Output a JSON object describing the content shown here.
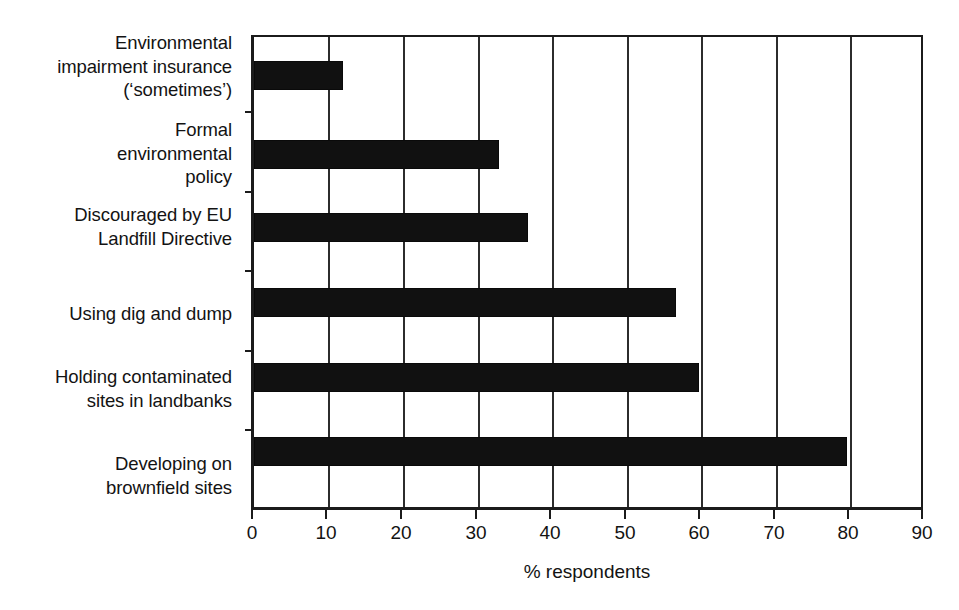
{
  "chart_data": {
    "type": "bar",
    "orientation": "horizontal",
    "title": "",
    "subtitle": "",
    "xlabel": "% respondents",
    "ylabel": "",
    "xlim": [
      0,
      90
    ],
    "xticks": [
      "0",
      "10",
      "20",
      "30",
      "40",
      "50",
      "60",
      "70",
      "80",
      "90"
    ],
    "grid": "vertical",
    "legend": "none",
    "bar_color": "#111111",
    "axis_color": "#1b1b1b",
    "categories": [
      "Environmental\nimpairment insurance\n(‘sometimes’)",
      "Formal\nenvironmental\npolicy",
      "Discouraged by EU\nLandfill Directive",
      "Using dig and dump",
      "Holding contaminated\nsites in landbanks",
      "Developing on\nbrownfield sites"
    ],
    "values": [
      12,
      33,
      37,
      57,
      60,
      80
    ],
    "annotations": []
  },
  "axis": {
    "x_title": "% respondents"
  }
}
